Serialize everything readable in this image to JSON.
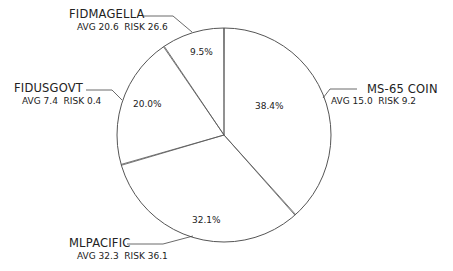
{
  "chart_data": {
    "type": "pie",
    "title": "",
    "start_angle_deg": 0,
    "direction": "clockwise",
    "slices": [
      {
        "name": "MS-65 COIN",
        "percent": 38.4,
        "label": "38.4%",
        "sub": "AVG 15.0  RISK 9.2",
        "avg": 15.0,
        "risk": 9.2
      },
      {
        "name": "MLPACIFIC",
        "percent": 32.1,
        "label": "32.1%",
        "sub": "AVG 32.3  RISK 36.1",
        "avg": 32.3,
        "risk": 36.1
      },
      {
        "name": "FIDUSGOVT",
        "percent": 20.0,
        "label": "20.0%",
        "sub": "AVG 7.4  RISK 0.4",
        "avg": 7.4,
        "risk": 0.4
      },
      {
        "name": "FIDMAGELLA",
        "percent": 9.5,
        "label": "9.5%",
        "sub": "AVG 20.6  RISK 26.6",
        "avg": 20.6,
        "risk": 26.6
      }
    ],
    "colors": {
      "line": "#555555",
      "fill": "#ffffff",
      "text": "#222222"
    }
  },
  "labels": {
    "ms65": {
      "name": "MS-65 COIN",
      "sub": "AVG 15.0  RISK 9.2",
      "pct": "38.4%"
    },
    "mlpacific": {
      "name": "MLPACIFIC",
      "sub": "AVG 32.3  RISK 36.1",
      "pct": "32.1%"
    },
    "fidusgovt": {
      "name": "FIDUSGOVT",
      "sub": "AVG 7.4  RISK 0.4",
      "pct": "20.0%"
    },
    "fidmagella": {
      "name": "FIDMAGELLA",
      "sub": "AVG 20.6  RISK 26.6",
      "pct": "9.5%"
    }
  }
}
